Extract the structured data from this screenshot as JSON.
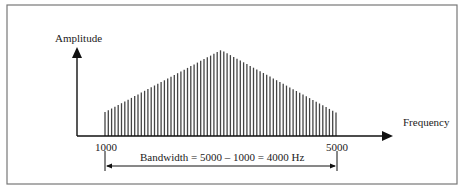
{
  "diagram": {
    "y_axis_label": "Amplitude",
    "x_axis_label": "Frequency",
    "low_freq_label": "1000",
    "high_freq_label": "5000",
    "bandwidth_label": "Bandwidth = 5000 – 1000  = 4000 Hz",
    "colors": {
      "line": "#111111",
      "bars": "#444444",
      "frame": "#777777"
    },
    "spectrum": {
      "start_freq": 1000,
      "peak_freq": 3000,
      "end_freq": 5000,
      "shape": "triangle"
    }
  }
}
